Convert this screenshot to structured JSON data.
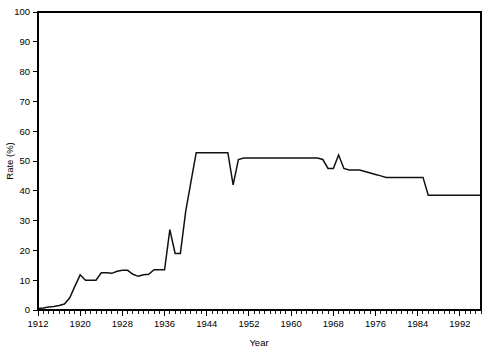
{
  "chart_data": {
    "type": "line",
    "title": "",
    "subtitle": "",
    "xlabel": "Year",
    "ylabel": "Rate (%)",
    "xlim": [
      1912,
      1996
    ],
    "ylim": [
      0,
      100
    ],
    "grid": false,
    "legend": null,
    "legend_position": "none",
    "x_major_ticks": [
      1912,
      1920,
      1928,
      1936,
      1944,
      1952,
      1960,
      1968,
      1976,
      1984,
      1992
    ],
    "x_major_tick_labels": [
      "1912",
      "1920",
      "1928",
      "1936",
      "1944",
      "1952",
      "1960",
      "1968",
      "1976",
      "1984",
      "1992"
    ],
    "x_minor_tick_interval": 1,
    "y_major_ticks": [
      0,
      10,
      20,
      30,
      40,
      50,
      60,
      70,
      80,
      90,
      100
    ],
    "y_major_tick_labels": [
      "0",
      "10",
      "20",
      "30",
      "40",
      "50",
      "60",
      "70",
      "80",
      "90",
      "100"
    ],
    "series": [
      {
        "name": "Rate",
        "color": "#111111",
        "x": [
          1912,
          1913,
          1914,
          1915,
          1916,
          1917,
          1918,
          1919,
          1920,
          1921,
          1922,
          1923,
          1924,
          1925,
          1926,
          1927,
          1928,
          1929,
          1930,
          1931,
          1932,
          1933,
          1934,
          1935,
          1936,
          1937,
          1938,
          1939,
          1940,
          1941,
          1942,
          1943,
          1944,
          1945,
          1946,
          1947,
          1948,
          1949,
          1950,
          1951,
          1952,
          1953,
          1954,
          1955,
          1956,
          1957,
          1958,
          1959,
          1960,
          1961,
          1962,
          1963,
          1964,
          1965,
          1966,
          1967,
          1968,
          1969,
          1970,
          1971,
          1972,
          1973,
          1974,
          1975,
          1976,
          1977,
          1978,
          1979,
          1980,
          1981,
          1982,
          1983,
          1984,
          1985,
          1986,
          1987,
          1988,
          1989,
          1990,
          1991,
          1992,
          1993,
          1994,
          1995,
          1996
        ],
        "y": [
          0.5,
          0.7,
          1.0,
          1.2,
          1.5,
          2.0,
          4.0,
          8.0,
          11.8,
          10.0,
          10.0,
          10.0,
          12.5,
          12.5,
          12.3,
          13.0,
          13.3,
          13.3,
          12.0,
          11.3,
          11.8,
          12.0,
          13.5,
          13.5,
          13.5,
          27.0,
          19.0,
          19.0,
          33.0,
          43.0,
          52.8,
          52.8,
          52.8,
          52.8,
          52.8,
          52.8,
          52.8,
          42.0,
          50.5,
          51.0,
          51.0,
          51.0,
          51.0,
          51.0,
          51.0,
          51.0,
          51.0,
          51.0,
          51.0,
          51.0,
          51.0,
          51.0,
          51.0,
          51.0,
          50.5,
          47.5,
          47.5,
          52.0,
          47.5,
          47.0,
          47.0,
          47.0,
          46.5,
          46.0,
          45.5,
          45.0,
          44.5,
          44.5,
          44.5,
          44.5,
          44.5,
          44.5,
          44.5,
          44.5,
          38.5,
          38.5,
          38.5,
          38.5,
          38.5,
          38.5,
          38.5,
          38.5,
          38.5,
          38.5,
          38.5
        ]
      }
    ]
  },
  "axes": {
    "y_title": "Rate (%)",
    "x_title": "Year"
  }
}
